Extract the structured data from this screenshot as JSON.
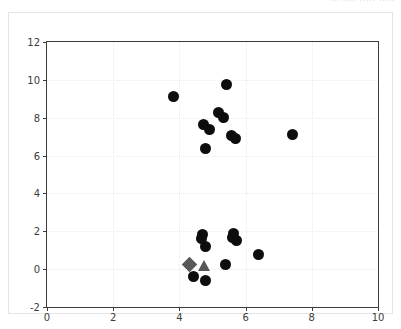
{
  "top_strip": {
    "clipped_text": "··· ···· ····· ·····"
  },
  "colors": {
    "marker_primary": "#0d0d0d",
    "marker_highlight": "#585858",
    "axis": "#3b3b3b",
    "grid": "#ebebee",
    "frame": "#e4e4e6",
    "background": "#ffffff"
  },
  "chart_data": {
    "type": "scatter",
    "title": "",
    "xlabel": "",
    "ylabel": "",
    "xlim": [
      0,
      10
    ],
    "ylim": [
      -2,
      12
    ],
    "xticks": [
      0,
      2,
      4,
      6,
      8,
      10
    ],
    "yticks": [
      -2,
      0,
      2,
      4,
      6,
      8,
      10,
      12
    ],
    "xticklabels": [
      "0",
      "2",
      "4",
      "6",
      "8",
      "10"
    ],
    "yticklabels": [
      "-2",
      "0",
      "2",
      "4",
      "6",
      "8",
      "10",
      "12"
    ],
    "grid": true,
    "legend": null,
    "series": [
      {
        "name": "data-points",
        "marker": "circle",
        "color": "#0d0d0d",
        "points": [
          {
            "x": 3.82,
            "y": 9.13
          },
          {
            "x": 5.42,
            "y": 9.77
          },
          {
            "x": 5.17,
            "y": 8.3
          },
          {
            "x": 5.32,
            "y": 8.02
          },
          {
            "x": 4.72,
            "y": 7.62
          },
          {
            "x": 4.92,
            "y": 7.4
          },
          {
            "x": 5.58,
            "y": 7.07
          },
          {
            "x": 5.68,
            "y": 6.92
          },
          {
            "x": 4.78,
            "y": 6.38
          },
          {
            "x": 7.42,
            "y": 7.1
          },
          {
            "x": 4.7,
            "y": 1.82
          },
          {
            "x": 4.66,
            "y": 1.6
          },
          {
            "x": 4.8,
            "y": 1.22
          },
          {
            "x": 5.62,
            "y": 1.88
          },
          {
            "x": 5.6,
            "y": 1.68
          },
          {
            "x": 5.72,
            "y": 1.52
          },
          {
            "x": 6.38,
            "y": 0.8
          },
          {
            "x": 5.38,
            "y": 0.22
          },
          {
            "x": 4.42,
            "y": -0.4
          },
          {
            "x": 4.8,
            "y": -0.62
          }
        ]
      },
      {
        "name": "highlight-diamond",
        "marker": "diamond",
        "color": "#585858",
        "points": [
          {
            "x": 4.3,
            "y": 0.22
          }
        ]
      },
      {
        "name": "highlight-triangle",
        "marker": "triangle",
        "color": "#585858",
        "points": [
          {
            "x": 4.74,
            "y": 0.18
          }
        ]
      }
    ]
  }
}
